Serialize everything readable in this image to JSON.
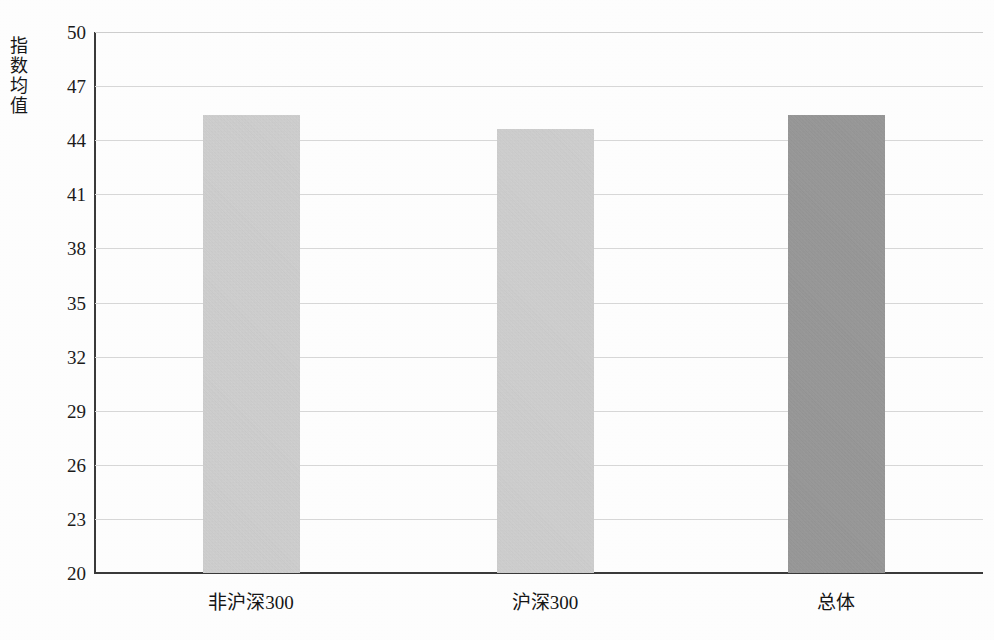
{
  "chart_data": {
    "type": "bar",
    "title": "",
    "xlabel": "",
    "ylabel": "指数均值",
    "categories": [
      "非沪深300",
      "沪深300",
      "总体"
    ],
    "values": [
      45.4,
      44.6,
      45.4
    ],
    "series": [
      {
        "name": "指数均值",
        "values": [
          45.4,
          44.6,
          45.4
        ]
      }
    ],
    "ylim": [
      20,
      50
    ],
    "ytick_labels": [
      "50",
      "47",
      "44",
      "41",
      "38",
      "35",
      "32",
      "29",
      "26",
      "23",
      "20"
    ],
    "ytick_values": [
      50,
      47,
      44,
      41,
      38,
      35,
      32,
      29,
      26,
      23,
      20
    ],
    "grid": "horizontal",
    "legend": "none",
    "bar_colors": [
      "#d5d5d5",
      "#d5d5d5",
      "#9a9a9a"
    ],
    "axis_color": "#3a3a3a",
    "gridline_color": "#d9d9d9",
    "background": "#ffffff"
  }
}
